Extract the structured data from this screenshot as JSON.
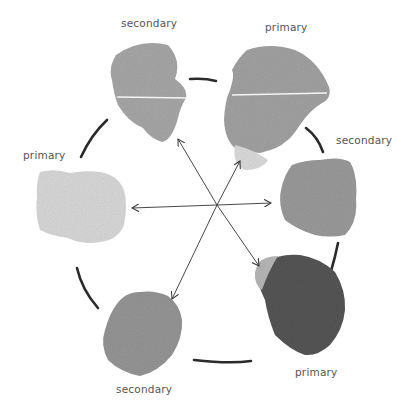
{
  "diagram": {
    "type": "color-wheel",
    "swatches": [
      {
        "id": "top-left",
        "label": "secondary",
        "tone": "#a9a9a9"
      },
      {
        "id": "top-right",
        "label": "primary",
        "tone": "#a4a4a4"
      },
      {
        "id": "right",
        "label": "secondary",
        "tone": "#9c9c9c"
      },
      {
        "id": "bottom-right",
        "label": "primary",
        "tone": "#5a5a5a"
      },
      {
        "id": "bottom-left",
        "label": "secondary",
        "tone": "#979797"
      },
      {
        "id": "left",
        "label": "primary",
        "tone": "#d8d8d8"
      }
    ],
    "arrows": [
      {
        "from": "top-left",
        "to": "bottom-right"
      },
      {
        "from": "top-right",
        "to": "bottom-left"
      },
      {
        "from": "left",
        "to": "right"
      }
    ]
  }
}
